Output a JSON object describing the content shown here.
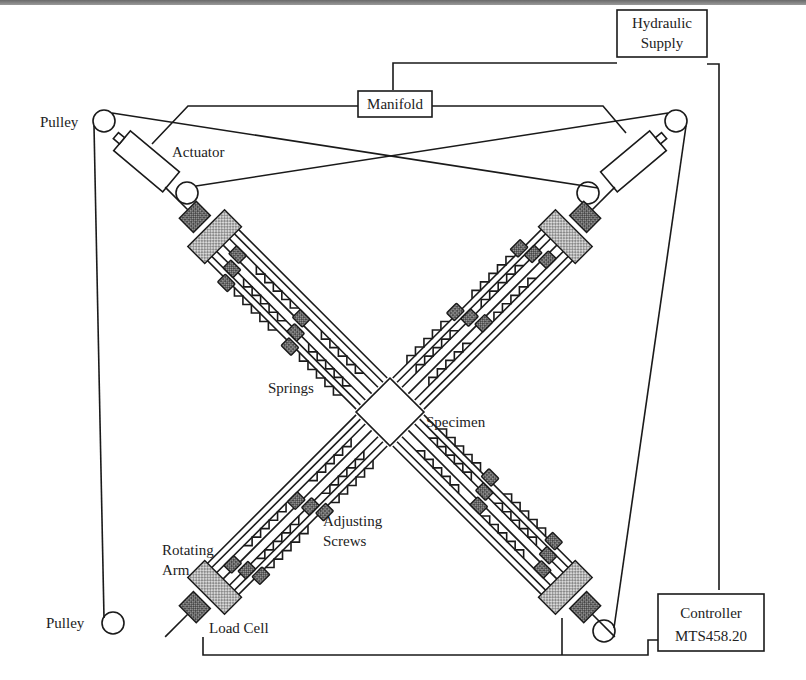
{
  "diagram": {
    "type": "schematic",
    "labels": {
      "hydraulic_supply_line1": "Hydraulic",
      "hydraulic_supply_line2": "Supply",
      "manifold": "Manifold",
      "pulley_top_left": "Pulley",
      "actuator": "Actuator",
      "springs": "Springs",
      "specimen": "Specimen",
      "adjusting_screws_line1": "Adjusting",
      "adjusting_screws_line2": "Screws",
      "rotating_arm_line1": "Rotating",
      "rotating_arm_line2": "Arm",
      "pulley_bottom_left": "Pulley",
      "load_cell": "Load Cell",
      "controller_line1": "Controller",
      "controller_line2": "MTS458.20"
    },
    "colors": {
      "line": "#1a1a1a",
      "text": "#222222",
      "background": "#ffffff",
      "hatch": "#555555"
    }
  }
}
